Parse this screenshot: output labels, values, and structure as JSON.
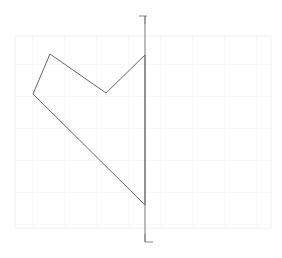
{
  "canvas": {
    "width": 282,
    "height": 258,
    "background_color": "#ffffff",
    "description": "technical line drawing of a closed arrowhead polygon crossed by a vertical axis line on a faint square grid"
  },
  "grid": {
    "visible": true,
    "color": "#f2f2f4",
    "cell_size": 32,
    "left": 15,
    "top": 36,
    "right": 271,
    "bottom": 228,
    "columns": 8,
    "rows": 6
  },
  "shape": {
    "name": "arrowhead-polygon",
    "stroke_color": "#555555",
    "stroke_width": 0.9,
    "fill": "none",
    "closed": true,
    "vertices": [
      {
        "label": "V1",
        "x": 145,
        "y": 55
      },
      {
        "label": "V2",
        "x": 106,
        "y": 93
      },
      {
        "label": "V3",
        "x": 50,
        "y": 54
      },
      {
        "label": "V4",
        "x": 33,
        "y": 94
      },
      {
        "label": "V5",
        "x": 145,
        "y": 205
      }
    ],
    "path": "M145,55 L106,93 L50,54 L33,94 L145,205 Z"
  },
  "axis_line": {
    "name": "vertical-axis-line",
    "stroke_color": "#6a6a6a",
    "stroke_width": 0.9,
    "x": 145,
    "y_start": 16,
    "y_end": 242
  },
  "markers": {
    "top": {
      "name": "top-corner-tick",
      "shape": "corner-bracket-upper-right",
      "x": 139,
      "y": 16,
      "arm_length": 8,
      "color": "#7a7a7a"
    },
    "bottom": {
      "name": "bottom-corner-tick",
      "shape": "corner-bracket-lower-left",
      "x": 139,
      "y": 242,
      "arm_length": 8,
      "color": "#7a7a7a"
    }
  },
  "chart_data": {
    "type": "scatter",
    "title": "",
    "xlabel": "",
    "ylabel": "",
    "grid": true,
    "legend": "none",
    "xlim": [
      0,
      282
    ],
    "ylim": [
      258,
      0
    ],
    "series": [
      {
        "name": "arrowhead-polygon-outline",
        "mode": "closed-polyline",
        "x": [
          145,
          106,
          50,
          33,
          145,
          145
        ],
        "y": [
          55,
          93,
          54,
          94,
          205,
          55
        ]
      },
      {
        "name": "vertical-axis-line",
        "mode": "line",
        "x": [
          145,
          145
        ],
        "y": [
          16,
          242
        ]
      }
    ]
  }
}
